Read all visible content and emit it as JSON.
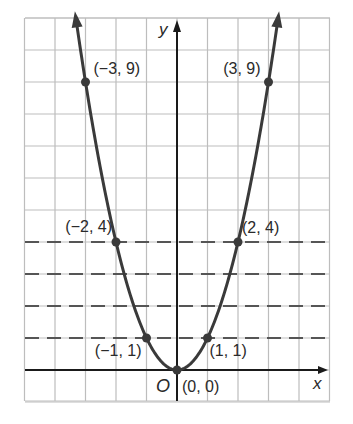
{
  "chart_data": {
    "type": "line",
    "title": "",
    "function": "y = x^2",
    "xlabel": "x",
    "ylabel": "y",
    "origin_label": "O",
    "xlim": [
      -5,
      5
    ],
    "ylim": [
      -1,
      11
    ],
    "grid": true,
    "x": [
      -3,
      -2,
      -1,
      0,
      1,
      2,
      3
    ],
    "values": [
      9,
      4,
      1,
      0,
      1,
      4,
      9
    ],
    "points": [
      {
        "x": -3,
        "y": 9,
        "label": "(−3, 9)"
      },
      {
        "x": 3,
        "y": 9,
        "label": "(3, 9)"
      },
      {
        "x": -2,
        "y": 4,
        "label": "(−2, 4)"
      },
      {
        "x": 2,
        "y": 4,
        "label": "(2, 4)"
      },
      {
        "x": -1,
        "y": 1,
        "label": "(−1, 1)"
      },
      {
        "x": 1,
        "y": 1,
        "label": "(1, 1)"
      },
      {
        "x": 0,
        "y": 0,
        "label": "(0, 0)"
      }
    ],
    "dashed_horizontal_lines_y": [
      1,
      2,
      3,
      4
    ],
    "colors": {
      "curve": "#3a3a3a",
      "grid": "#bdbdbd",
      "axes": "#1a1a1a",
      "dashed": "#555555"
    }
  }
}
